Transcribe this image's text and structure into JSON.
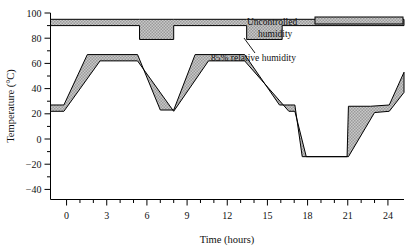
{
  "chart_data": {
    "type": "area",
    "title": "",
    "xlabel": "Time (hours)",
    "ylabel": "Temperature (°C)",
    "xlim": [
      -1.2,
      25.2
    ],
    "ylim": [
      -48,
      100
    ],
    "xticks": [
      0,
      3,
      6,
      9,
      12,
      15,
      18,
      21,
      24
    ],
    "xtick_labels": [
      "0",
      "3",
      "6",
      "9",
      "12",
      "15",
      "18",
      "21",
      "24"
    ],
    "xtick_minor_step": 1,
    "yticks": [
      -40,
      -20,
      0,
      20,
      40,
      60,
      80,
      100
    ],
    "ytick_labels": [
      "−40",
      "−20",
      "0",
      "20",
      "40",
      "60",
      "80",
      "100"
    ],
    "ytick_minor_step": 10,
    "grid": false,
    "legend_position": "inside-top-right",
    "series": [
      {
        "name": "Uncontrolled humidity",
        "fill": "band",
        "upper": {
          "x": [
            -1.2,
            5.45,
            5.45,
            8.0,
            8.0,
            13.45,
            13.45,
            16.1,
            16.1,
            25.2
          ],
          "y": [
            95,
            95,
            95,
            95,
            95,
            95,
            95,
            95,
            95,
            95
          ]
        },
        "lower": {
          "x": [
            -1.2,
            5.45,
            5.45,
            8.0,
            8.0,
            13.45,
            13.45,
            16.1,
            16.1,
            25.2
          ],
          "y": [
            90,
            90,
            79,
            79,
            90,
            90,
            79,
            79,
            90,
            90
          ]
        }
      },
      {
        "name": "85% relative humidity",
        "fill": "band",
        "upper": {
          "x": [
            -1.2,
            -0.2,
            1.55,
            5.3,
            7.0,
            8.0,
            9.6,
            13.3,
            15.9,
            17.05,
            17.6,
            20.95,
            21.05,
            22.7,
            24.1,
            25.2
          ],
          "y": [
            27,
            27,
            67,
            67,
            23,
            23,
            67,
            67,
            27,
            27,
            -14,
            -14,
            26,
            26,
            27,
            53
          ]
        },
        "lower": {
          "x": [
            -1.2,
            -0.2,
            2.5,
            5.3,
            8.0,
            10.6,
            13.3,
            16.6,
            17.05,
            17.9,
            20.95,
            21.05,
            23.0,
            24.1,
            25.2
          ],
          "y": [
            22,
            22,
            62,
            62,
            22,
            62,
            62,
            22,
            22,
            -14,
            -14,
            -14,
            21,
            22,
            37
          ]
        }
      }
    ],
    "annotations": [
      {
        "text": "Uncontrolled",
        "x_px": 247,
        "y_px": 25
      },
      {
        "text": "humidity",
        "x_px": 258,
        "y_px": 37
      },
      {
        "text": "85% relative humidity",
        "x_px": 211,
        "y_px": 58
      }
    ],
    "colors": {
      "band_fill": "#b3b3b3",
      "band_edge": "#000000",
      "axis": "#000000",
      "text": "#000000",
      "background": "#ffffff"
    }
  }
}
